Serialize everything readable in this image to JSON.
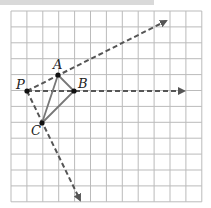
{
  "diagram": {
    "grid": {
      "x0": 11,
      "y0": 11,
      "cell": 15.9,
      "cols": 12,
      "rows": 12,
      "color": "#bbbbbb"
    },
    "points": {
      "P": {
        "label": "P",
        "x": 27,
        "y": 91
      },
      "A": {
        "label": "A",
        "x": 58,
        "y": 75
      },
      "B": {
        "label": "B",
        "x": 74,
        "y": 91
      },
      "C": {
        "label": "C",
        "x": 42,
        "y": 123
      }
    },
    "triangle_color": "#777777",
    "ray_color": "#555555",
    "rays": [
      {
        "name": "ray-PA",
        "x1": 27,
        "y1": 91,
        "x2": 166,
        "y2": 21
      },
      {
        "name": "ray-PB",
        "x1": 27,
        "y1": 91,
        "x2": 184,
        "y2": 91
      },
      {
        "name": "ray-PC",
        "x1": 27,
        "y1": 91,
        "x2": 80,
        "y2": 200
      }
    ]
  }
}
